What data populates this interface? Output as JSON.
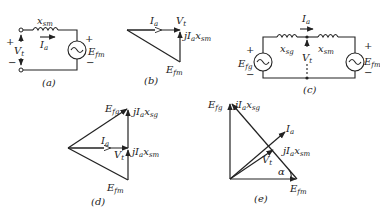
{
  "figure": {
    "panels": {
      "a": {
        "caption": "(a)",
        "type": "circuit",
        "labels": {
          "reactance": "x",
          "reactance_sub": "sm",
          "current": "I",
          "current_sub": "a",
          "voltage": "V",
          "voltage_sub": "t",
          "source": "E",
          "source_sub": "fm",
          "plus": "+",
          "minus": "−"
        }
      },
      "b": {
        "caption": "(b)",
        "type": "phasor",
        "labels": {
          "current": "I",
          "current_sub": "a",
          "voltage": "V",
          "voltage_sub": "t",
          "drop": "jI",
          "drop_sub1": "a",
          "drop_x": "x",
          "drop_sub2": "sm",
          "emf": "E",
          "emf_sub": "fm"
        }
      },
      "c": {
        "caption": "(c)",
        "type": "circuit",
        "labels": {
          "current": "I",
          "current_sub": "a",
          "xg": "x",
          "xg_sub": "sg",
          "xm": "x",
          "xm_sub": "sm",
          "voltage": "V",
          "voltage_sub": "t",
          "src_left": "E",
          "src_left_sub": "fg",
          "src_right": "E",
          "src_right_sub": "fm",
          "plus": "+",
          "minus": "−"
        }
      },
      "d": {
        "caption": "(d)",
        "type": "phasor",
        "labels": {
          "efg": "E",
          "efg_sub": "fg",
          "drop_g": "jI",
          "drop_g_sub1": "a",
          "drop_g_x": "x",
          "drop_g_sub2": "sg",
          "current": "I",
          "current_sub": "a",
          "voltage": "V",
          "voltage_sub": "t",
          "drop_m": "jI",
          "drop_m_sub1": "a",
          "drop_m_x": "x",
          "drop_m_sub2": "sm",
          "efm": "E",
          "efm_sub": "fm"
        }
      },
      "e": {
        "caption": "(e)",
        "type": "phasor",
        "labels": {
          "efg": "E",
          "efg_sub": "fg",
          "drop_g": "jI",
          "drop_g_sub1": "a",
          "drop_g_x": "x",
          "drop_g_sub2": "sg",
          "current": "I",
          "current_sub": "a",
          "drop_m": "jI",
          "drop_m_sub1": "a",
          "drop_m_x": "x",
          "drop_m_sub2": "sm",
          "voltage": "V",
          "voltage_sub": "t",
          "angle": "α",
          "efm": "E",
          "efm_sub": "fm"
        }
      }
    }
  }
}
